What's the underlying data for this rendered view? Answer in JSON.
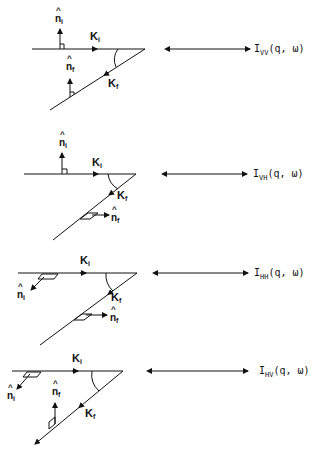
{
  "figure": {
    "panels": [
      {
        "id": "VV",
        "k_i_label": "K",
        "k_i_sub": "i",
        "k_f_label": "K",
        "k_f_sub": "f",
        "n_i_label": "n",
        "n_i_sub": "i",
        "n_f_label": "n",
        "n_f_sub": "f",
        "hat": "^",
        "intensity_symbol": "I",
        "intensity_sub": "VV",
        "intensity_args": "(q, ω)"
      },
      {
        "id": "VH",
        "k_i_label": "K",
        "k_i_sub": "i",
        "k_f_label": "K",
        "k_f_sub": "f",
        "n_i_label": "n",
        "n_i_sub": "i",
        "n_f_label": "n",
        "n_f_sub": "f",
        "hat": "^",
        "intensity_symbol": "I",
        "intensity_sub": "VH",
        "intensity_args": "(q, ω)"
      },
      {
        "id": "HH",
        "k_i_label": "K",
        "k_i_sub": "i",
        "k_f_label": "K",
        "k_f_sub": "f",
        "n_i_label": "n",
        "n_i_sub": "i",
        "n_f_label": "n",
        "n_f_sub": "f",
        "hat": "^",
        "intensity_symbol": "I",
        "intensity_sub": "HH",
        "intensity_args": "(q, ω)"
      },
      {
        "id": "HV",
        "k_i_label": "K",
        "k_i_sub": "i",
        "k_f_label": "K",
        "k_f_sub": "f",
        "n_i_label": "n",
        "n_i_sub": "i",
        "n_f_label": "n",
        "n_f_sub": "f",
        "hat": "^",
        "intensity_symbol": "I",
        "intensity_sub": "HV",
        "intensity_args": "(q, ω)"
      }
    ],
    "colors": {
      "ink": "#111111",
      "background": "#ffffff"
    }
  }
}
